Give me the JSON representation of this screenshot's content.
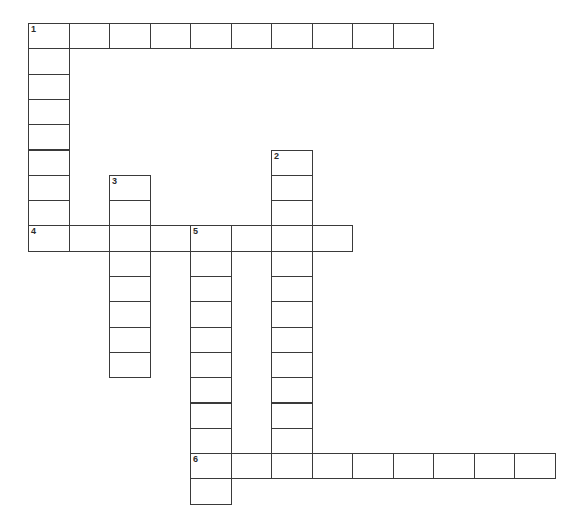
{
  "puzzle": {
    "title": "Crossword Puzzle Grid",
    "cell_width": 40.5,
    "cell_height": 25.3,
    "origin_x": 28,
    "origin_y": 23,
    "border_color": "#3a3a3a",
    "cell_fill": "#ffffff",
    "background": "#ffffff",
    "number_color": "#2b2b2b"
  },
  "entries": [
    {
      "number": "1",
      "direction": "across",
      "row": 0,
      "col": 0,
      "length": 10
    },
    {
      "number": "1",
      "direction": "down",
      "row": 0,
      "col": 0,
      "length": 9
    },
    {
      "number": "2",
      "direction": "down",
      "row": 5,
      "col": 6,
      "length": 13
    },
    {
      "number": "3",
      "direction": "down",
      "row": 6,
      "col": 2,
      "length": 8
    },
    {
      "number": "4",
      "direction": "across",
      "row": 8,
      "col": 0,
      "length": 8
    },
    {
      "number": "5",
      "direction": "down",
      "row": 8,
      "col": 4,
      "length": 12
    },
    {
      "number": "6",
      "direction": "across",
      "row": 17,
      "col": 4,
      "length": 9
    }
  ],
  "cells": [
    {
      "row": 0,
      "col": 0,
      "number": "1",
      "letter": ""
    },
    {
      "row": 0,
      "col": 1,
      "number": "",
      "letter": ""
    },
    {
      "row": 0,
      "col": 2,
      "number": "",
      "letter": ""
    },
    {
      "row": 0,
      "col": 3,
      "number": "",
      "letter": ""
    },
    {
      "row": 0,
      "col": 4,
      "number": "",
      "letter": ""
    },
    {
      "row": 0,
      "col": 5,
      "number": "",
      "letter": ""
    },
    {
      "row": 0,
      "col": 6,
      "number": "",
      "letter": ""
    },
    {
      "row": 0,
      "col": 7,
      "number": "",
      "letter": ""
    },
    {
      "row": 0,
      "col": 8,
      "number": "",
      "letter": ""
    },
    {
      "row": 0,
      "col": 9,
      "number": "",
      "letter": ""
    },
    {
      "row": 1,
      "col": 0,
      "number": "",
      "letter": ""
    },
    {
      "row": 2,
      "col": 0,
      "number": "",
      "letter": ""
    },
    {
      "row": 3,
      "col": 0,
      "number": "",
      "letter": ""
    },
    {
      "row": 4,
      "col": 0,
      "number": "",
      "letter": ""
    },
    {
      "row": 5,
      "col": 0,
      "number": "",
      "letter": ""
    },
    {
      "row": 6,
      "col": 0,
      "number": "",
      "letter": ""
    },
    {
      "row": 7,
      "col": 0,
      "number": "",
      "letter": ""
    },
    {
      "row": 5,
      "col": 6,
      "number": "2",
      "letter": ""
    },
    {
      "row": 6,
      "col": 6,
      "number": "",
      "letter": ""
    },
    {
      "row": 7,
      "col": 6,
      "number": "",
      "letter": ""
    },
    {
      "row": 6,
      "col": 2,
      "number": "3",
      "letter": ""
    },
    {
      "row": 7,
      "col": 2,
      "number": "",
      "letter": ""
    },
    {
      "row": 8,
      "col": 0,
      "number": "4",
      "letter": ""
    },
    {
      "row": 8,
      "col": 1,
      "number": "",
      "letter": ""
    },
    {
      "row": 8,
      "col": 2,
      "number": "",
      "letter": ""
    },
    {
      "row": 8,
      "col": 3,
      "number": "",
      "letter": ""
    },
    {
      "row": 8,
      "col": 4,
      "number": "5",
      "letter": ""
    },
    {
      "row": 8,
      "col": 5,
      "number": "",
      "letter": ""
    },
    {
      "row": 8,
      "col": 6,
      "number": "",
      "letter": ""
    },
    {
      "row": 8,
      "col": 7,
      "number": "",
      "letter": ""
    },
    {
      "row": 9,
      "col": 2,
      "number": "",
      "letter": ""
    },
    {
      "row": 10,
      "col": 2,
      "number": "",
      "letter": ""
    },
    {
      "row": 11,
      "col": 2,
      "number": "",
      "letter": ""
    },
    {
      "row": 12,
      "col": 2,
      "number": "",
      "letter": ""
    },
    {
      "row": 13,
      "col": 2,
      "number": "",
      "letter": ""
    },
    {
      "row": 9,
      "col": 4,
      "number": "",
      "letter": ""
    },
    {
      "row": 10,
      "col": 4,
      "number": "",
      "letter": ""
    },
    {
      "row": 11,
      "col": 4,
      "number": "",
      "letter": ""
    },
    {
      "row": 12,
      "col": 4,
      "number": "",
      "letter": ""
    },
    {
      "row": 13,
      "col": 4,
      "number": "",
      "letter": ""
    },
    {
      "row": 14,
      "col": 4,
      "number": "",
      "letter": ""
    },
    {
      "row": 15,
      "col": 4,
      "number": "",
      "letter": ""
    },
    {
      "row": 16,
      "col": 4,
      "number": "",
      "letter": ""
    },
    {
      "row": 8,
      "col": 6,
      "number": "",
      "letter": ""
    },
    {
      "row": 9,
      "col": 6,
      "number": "",
      "letter": ""
    },
    {
      "row": 10,
      "col": 6,
      "number": "",
      "letter": ""
    },
    {
      "row": 11,
      "col": 6,
      "number": "",
      "letter": ""
    },
    {
      "row": 12,
      "col": 6,
      "number": "",
      "letter": ""
    },
    {
      "row": 13,
      "col": 6,
      "number": "",
      "letter": ""
    },
    {
      "row": 14,
      "col": 6,
      "number": "",
      "letter": ""
    },
    {
      "row": 15,
      "col": 6,
      "number": "",
      "letter": ""
    },
    {
      "row": 16,
      "col": 6,
      "number": "",
      "letter": ""
    },
    {
      "row": 17,
      "col": 4,
      "number": "6",
      "letter": ""
    },
    {
      "row": 17,
      "col": 5,
      "number": "",
      "letter": ""
    },
    {
      "row": 17,
      "col": 6,
      "number": "",
      "letter": ""
    },
    {
      "row": 17,
      "col": 7,
      "number": "",
      "letter": ""
    },
    {
      "row": 17,
      "col": 8,
      "number": "",
      "letter": ""
    },
    {
      "row": 17,
      "col": 9,
      "number": "",
      "letter": ""
    },
    {
      "row": 17,
      "col": 10,
      "number": "",
      "letter": ""
    },
    {
      "row": 17,
      "col": 11,
      "number": "",
      "letter": ""
    },
    {
      "row": 17,
      "col": 12,
      "number": "",
      "letter": ""
    },
    {
      "row": 18,
      "col": 4,
      "number": "",
      "letter": ""
    }
  ]
}
